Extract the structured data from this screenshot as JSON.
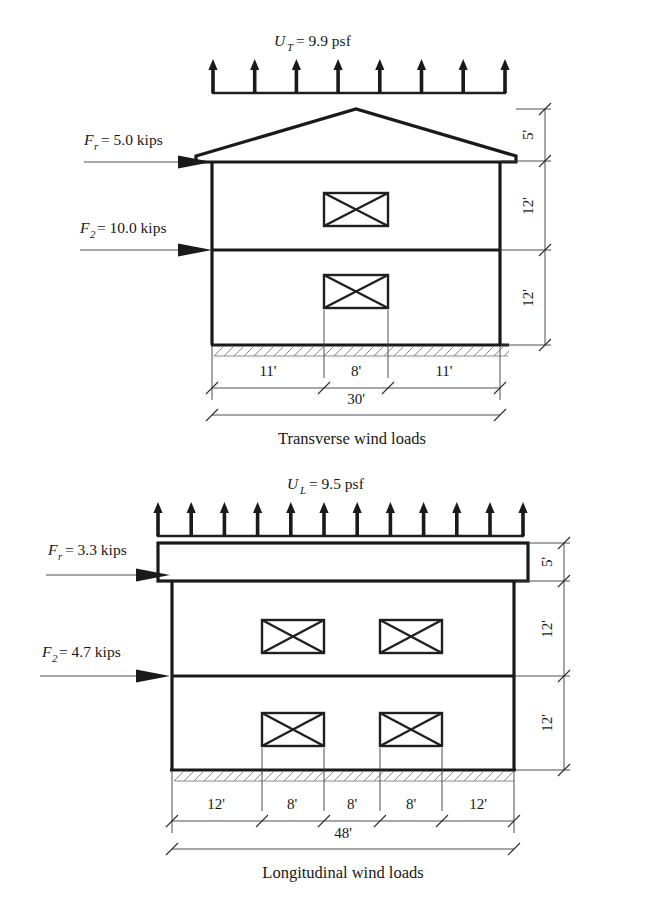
{
  "figures": [
    {
      "id": "transverse",
      "caption": "Transverse wind loads",
      "uplift": {
        "symbol": "U",
        "subscript": "T",
        "equals": "= 9.9 psf",
        "full": "U_T = 9.9 psf",
        "value": 9.9,
        "units": "psf",
        "arrow_count": 8,
        "direction": "up"
      },
      "forces": [
        {
          "symbol": "F",
          "subscript": "r",
          "equals": "= 5.0 kips",
          "full": "F_r = 5.0 kips",
          "value": 5.0,
          "units": "kips",
          "level": "roof",
          "direction": "right"
        },
        {
          "symbol": "F",
          "subscript": "2",
          "equals": "= 10.0 kips",
          "full": "F_2 = 10.0 kips",
          "value": 10.0,
          "units": "kips",
          "level": "second-floor",
          "direction": "right"
        }
      ],
      "vertical_dimensions": [
        "5'",
        "12'",
        "12'"
      ],
      "horizontal_dimensions": [
        "11'",
        "8'",
        "11'"
      ],
      "overall_dimension": "30'",
      "roof_type": "gable",
      "stories": 2,
      "braced_panels_per_story": 1
    },
    {
      "id": "longitudinal",
      "caption": "Longitudinal wind loads",
      "uplift": {
        "symbol": "U",
        "subscript": "L",
        "equals": "= 9.5 psf",
        "full": "U_L = 9.5 psf",
        "value": 9.5,
        "units": "psf",
        "arrow_count": 12,
        "direction": "up"
      },
      "forces": [
        {
          "symbol": "F",
          "subscript": "r",
          "equals": "= 3.3 kips",
          "full": "F_r = 3.3 kips",
          "value": 3.3,
          "units": "kips",
          "level": "roof",
          "direction": "right"
        },
        {
          "symbol": "F",
          "subscript": "2",
          "equals": "= 4.7 kips",
          "full": "F_2 = 4.7 kips",
          "value": 4.7,
          "units": "kips",
          "level": "second-floor",
          "direction": "right"
        }
      ],
      "vertical_dimensions": [
        "5'",
        "12'",
        "12'"
      ],
      "horizontal_dimensions": [
        "12'",
        "8'",
        "8'",
        "8'",
        "12'"
      ],
      "overall_dimension": "48'",
      "roof_type": "flat",
      "stories": 2,
      "braced_panels_per_story": 2
    }
  ],
  "colors": {
    "line": "#1a1a1a",
    "text": "#171717",
    "hatch": "#8c8c8c",
    "background": "#ffffff"
  }
}
